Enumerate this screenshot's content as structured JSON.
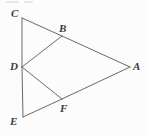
{
  "figure": {
    "kind": "geometry-diagram",
    "canvas": {
      "width": 147,
      "height": 135
    },
    "style": {
      "background_color": "#fcfcfc",
      "stroke_color": "#6a6a6a",
      "stroke_width": 1,
      "label_color": "#3b3b3b",
      "label_style": "italic-serif-bold"
    },
    "points": [
      {
        "name": "C",
        "label": "C",
        "x": 22,
        "y": 18,
        "label_x": 11,
        "label_y": 8
      },
      {
        "name": "B",
        "label": "B",
        "x": 62,
        "y": 36,
        "label_x": 59,
        "label_y": 23
      },
      {
        "name": "A",
        "label": "A",
        "x": 130,
        "y": 67,
        "label_x": 133,
        "label_y": 61
      },
      {
        "name": "D",
        "label": "D",
        "x": 22,
        "y": 67,
        "label_x": 10,
        "label_y": 61
      },
      {
        "name": "F",
        "label": "F",
        "x": 62,
        "y": 99,
        "label_x": 60,
        "label_y": 103
      },
      {
        "name": "E",
        "label": "E",
        "x": 23,
        "y": 117,
        "label_x": 10,
        "label_y": 116
      }
    ],
    "segments": [
      {
        "name": "segment-CD",
        "from": "C",
        "to": "D"
      },
      {
        "name": "segment-DE",
        "from": "D",
        "to": "E"
      },
      {
        "name": "segment-CB",
        "from": "C",
        "to": "B"
      },
      {
        "name": "segment-BD",
        "from": "B",
        "to": "D"
      },
      {
        "name": "segment-BA",
        "from": "B",
        "to": "A"
      },
      {
        "name": "segment-DF",
        "from": "D",
        "to": "F"
      },
      {
        "name": "segment-FA",
        "from": "F",
        "to": "A"
      },
      {
        "name": "segment-EF",
        "from": "E",
        "to": "F"
      }
    ],
    "artifacts": [
      {
        "name": "top-crop-mark-left",
        "x": 6,
        "y": 1,
        "width": 13,
        "height": 2
      },
      {
        "name": "top-crop-mark-right",
        "x": 24,
        "y": 1,
        "width": 9,
        "height": 2
      }
    ]
  }
}
